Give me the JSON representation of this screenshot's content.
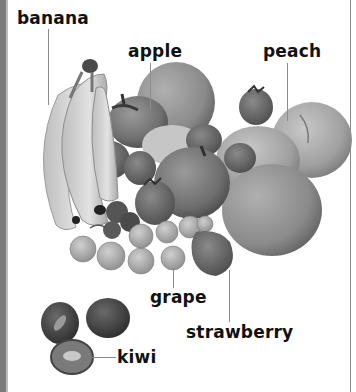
{
  "illustration": {
    "kind": "picture-dictionary fruit illustration (grayscale)",
    "labels": {
      "banana": "banana",
      "apple": "apple",
      "peach": "peach",
      "grape": "grape",
      "strawberry": "strawberry",
      "kiwi": "kiwi"
    },
    "colors": {
      "background": "#ffffff",
      "border_left": "#7c7c7c",
      "border_right": "#8a8a8a",
      "label_text": "#111111",
      "leader_line": "#8c8c8c"
    }
  }
}
